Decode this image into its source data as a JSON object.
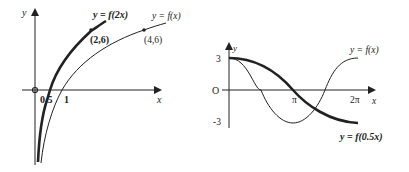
{
  "left_graph": {
    "axis_x_label": "x",
    "axis_y_label": "y",
    "origin_label": "",
    "tick_labels": {
      "half": "0.5",
      "one": "1"
    },
    "curves": [
      {
        "name": "y = f(2x)",
        "label": "y = f(2x)",
        "style": "thick",
        "point_label": "(2,6)"
      },
      {
        "name": "y = f(x)",
        "label": "y = f(x)",
        "style": "thin",
        "point_label": "(4,6)"
      }
    ]
  },
  "right_graph": {
    "axis_x_label": "x",
    "axis_y_label": "y",
    "origin_label": "O",
    "y_ticks": {
      "top": "3",
      "bottom": "-3"
    },
    "x_ticks": {
      "pi": "π",
      "two_pi": "2π"
    },
    "curves": [
      {
        "name": "y = f(x)",
        "label": "y = f(x)",
        "style": "thin"
      },
      {
        "name": "y = f(0.5x)",
        "label": "y = f(0.5x)",
        "style": "thick"
      }
    ]
  },
  "colors": {
    "ink": "#222222",
    "background": "#ffffff"
  }
}
